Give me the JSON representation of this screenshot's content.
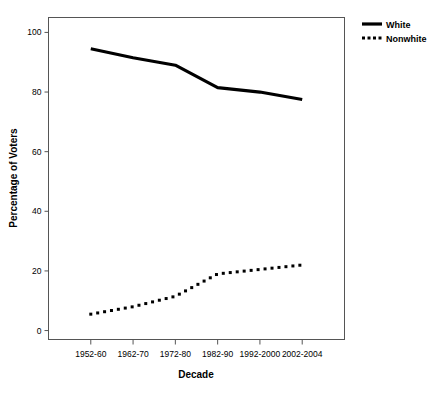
{
  "chart_data": {
    "type": "line",
    "title": "",
    "subtitle": "",
    "xlabel": "Decade",
    "ylabel": "Percentage of Voters",
    "categories": [
      "1952-60",
      "1962-70",
      "1972-80",
      "1982-90",
      "1992-2000",
      "2002-2004"
    ],
    "yticks": [
      0,
      20,
      40,
      60,
      80,
      100
    ],
    "ylim": [
      -3,
      105
    ],
    "xlim": [
      0,
      7
    ],
    "grid": false,
    "legend_position": "top-right-outside",
    "series": [
      {
        "name": "White",
        "style": "solid",
        "color": "#000000",
        "values": [
          94.5,
          91.5,
          89.0,
          81.5,
          80.0,
          77.5
        ]
      },
      {
        "name": "Nonwhite",
        "style": "dotted",
        "color": "#000000",
        "values": [
          5.5,
          8.0,
          11.5,
          19.0,
          20.5,
          22.0
        ]
      }
    ]
  },
  "legend": {
    "items": [
      {
        "label": "White",
        "style": "solid"
      },
      {
        "label": "Nonwhite",
        "style": "dotted"
      }
    ]
  },
  "axes": {
    "x_title": "Decade",
    "y_title": "Percentage of Voters",
    "y_tick_labels": [
      "100",
      "80",
      "60",
      "40",
      "20",
      "0"
    ],
    "x_tick_labels": [
      "1952-60",
      "1962-70",
      "1972-80",
      "1982-90",
      "1992-2000",
      "2002-2004"
    ]
  },
  "colors": {
    "ink": "#000000",
    "frame": "#555555",
    "background": "#ffffff"
  }
}
